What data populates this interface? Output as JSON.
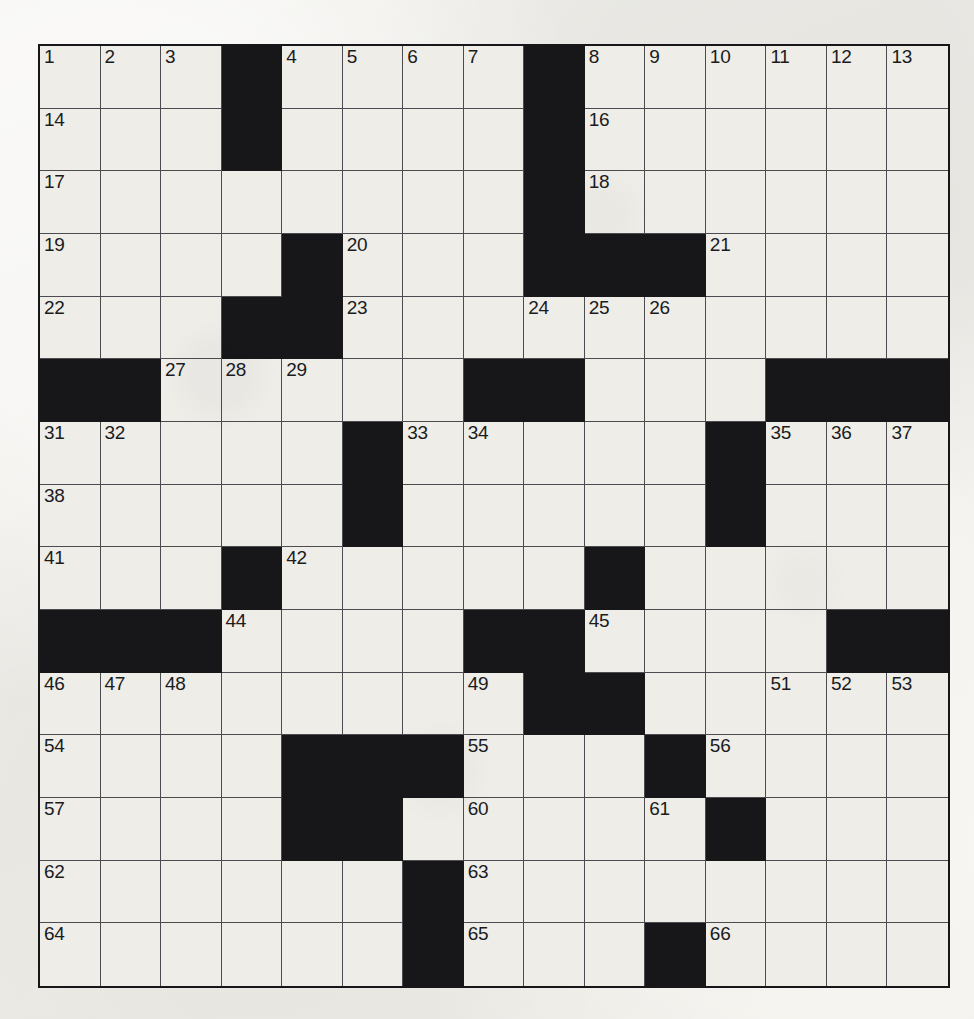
{
  "puzzle": {
    "kind": "crossword-grid",
    "size": {
      "rows": 15,
      "cols": 15
    },
    "colors": {
      "paper": "#efeeea",
      "cell_fill": "#eeede8",
      "block_fill": "#17171a",
      "grid_line": "#4c4c50",
      "border": "#17171a",
      "number_text": "#1b1b1e"
    },
    "legend": {
      "open_symbol": "_",
      "block_symbol": "#"
    },
    "grid_rows": [
      "___#____#______",
      "___#____#______",
      "________#______",
      "____#___###____",
      "___##__________",
      "##_____##___###",
      "_____#_____#___",
      "_____#_____#___",
      "___#_____#_____",
      "###____##____##",
      "________##_____",
      "____###___#____",
      "____##_____#___",
      "______#________",
      "______#___#____"
    ],
    "numbers": [
      {
        "row": 0,
        "col": 0,
        "label": "1"
      },
      {
        "row": 0,
        "col": 1,
        "label": "2"
      },
      {
        "row": 0,
        "col": 2,
        "label": "3"
      },
      {
        "row": 0,
        "col": 4,
        "label": "4"
      },
      {
        "row": 0,
        "col": 5,
        "label": "5"
      },
      {
        "row": 0,
        "col": 6,
        "label": "6"
      },
      {
        "row": 0,
        "col": 7,
        "label": "7"
      },
      {
        "row": 0,
        "col": 9,
        "label": "8"
      },
      {
        "row": 0,
        "col": 10,
        "label": "9"
      },
      {
        "row": 0,
        "col": 11,
        "label": "10"
      },
      {
        "row": 0,
        "col": 12,
        "label": "11"
      },
      {
        "row": 0,
        "col": 13,
        "label": "12"
      },
      {
        "row": 0,
        "col": 14,
        "label": "13"
      },
      {
        "row": 1,
        "col": 0,
        "label": "14"
      },
      {
        "row": 1,
        "col": 3,
        "label": "15"
      },
      {
        "row": 1,
        "col": 9,
        "label": "16"
      },
      {
        "row": 2,
        "col": 0,
        "label": "17"
      },
      {
        "row": 2,
        "col": 9,
        "label": "18"
      },
      {
        "row": 3,
        "col": 0,
        "label": "19"
      },
      {
        "row": 3,
        "col": 5,
        "label": "20"
      },
      {
        "row": 3,
        "col": 11,
        "label": "21"
      },
      {
        "row": 4,
        "col": 0,
        "label": "22"
      },
      {
        "row": 4,
        "col": 5,
        "label": "23"
      },
      {
        "row": 4,
        "col": 8,
        "label": "24"
      },
      {
        "row": 4,
        "col": 9,
        "label": "25"
      },
      {
        "row": 4,
        "col": 10,
        "label": "26"
      },
      {
        "row": 5,
        "col": 2,
        "label": "27"
      },
      {
        "row": 5,
        "col": 3,
        "label": "28"
      },
      {
        "row": 5,
        "col": 4,
        "label": "29"
      },
      {
        "row": 5,
        "col": 8,
        "label": "30"
      },
      {
        "row": 6,
        "col": 0,
        "label": "31"
      },
      {
        "row": 6,
        "col": 1,
        "label": "32"
      },
      {
        "row": 6,
        "col": 6,
        "label": "33"
      },
      {
        "row": 6,
        "col": 7,
        "label": "34"
      },
      {
        "row": 6,
        "col": 12,
        "label": "35"
      },
      {
        "row": 6,
        "col": 13,
        "label": "36"
      },
      {
        "row": 6,
        "col": 14,
        "label": "37"
      },
      {
        "row": 7,
        "col": 0,
        "label": "38"
      },
      {
        "row": 7,
        "col": 5,
        "label": "39"
      },
      {
        "row": 7,
        "col": 11,
        "label": "40"
      },
      {
        "row": 8,
        "col": 0,
        "label": "41"
      },
      {
        "row": 8,
        "col": 4,
        "label": "42"
      },
      {
        "row": 8,
        "col": 9,
        "label": "43"
      },
      {
        "row": 9,
        "col": 3,
        "label": "44"
      },
      {
        "row": 9,
        "col": 9,
        "label": "45"
      },
      {
        "row": 10,
        "col": 0,
        "label": "46"
      },
      {
        "row": 10,
        "col": 1,
        "label": "47"
      },
      {
        "row": 10,
        "col": 2,
        "label": "48"
      },
      {
        "row": 10,
        "col": 7,
        "label": "49"
      },
      {
        "row": 10,
        "col": 8,
        "label": "50"
      },
      {
        "row": 10,
        "col": 12,
        "label": "51"
      },
      {
        "row": 10,
        "col": 13,
        "label": "52"
      },
      {
        "row": 10,
        "col": 14,
        "label": "53"
      },
      {
        "row": 11,
        "col": 0,
        "label": "54"
      },
      {
        "row": 11,
        "col": 7,
        "label": "55"
      },
      {
        "row": 11,
        "col": 11,
        "label": "56"
      },
      {
        "row": 12,
        "col": 0,
        "label": "57"
      },
      {
        "row": 12,
        "col": 4,
        "label": "58"
      },
      {
        "row": 12,
        "col": 5,
        "label": "59"
      },
      {
        "row": 12,
        "col": 7,
        "label": "60"
      },
      {
        "row": 12,
        "col": 10,
        "label": "61"
      },
      {
        "row": 13,
        "col": 0,
        "label": "62"
      },
      {
        "row": 13,
        "col": 7,
        "label": "63"
      },
      {
        "row": 14,
        "col": 0,
        "label": "64"
      },
      {
        "row": 14,
        "col": 7,
        "label": "65"
      },
      {
        "row": 14,
        "col": 11,
        "label": "66"
      }
    ],
    "entries": []
  }
}
